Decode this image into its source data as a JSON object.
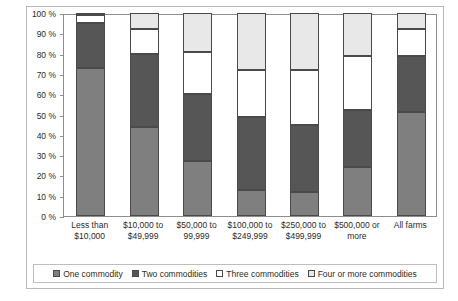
{
  "chart_data": {
    "type": "bar",
    "title": "",
    "subtitle": "",
    "xlabel": "",
    "ylabel": "",
    "ylim": [
      0,
      100
    ],
    "grid": false,
    "stacked": true,
    "stack_total": 100,
    "legend_position": "bottom",
    "categories": [
      "Less than $10,000",
      "$10,000 to $49,999",
      "$50,000 to 99,999",
      "$100,000 to $249,999",
      "$250,000 to $499,999",
      "$500,000 or more",
      "All farms"
    ],
    "category_lines": [
      [
        "Less than",
        "$10,000"
      ],
      [
        "$10,000 to",
        "$49,999"
      ],
      [
        "$50,000 to",
        "99,999"
      ],
      [
        "$100,000 to",
        "$249,999"
      ],
      [
        "$250,000 to",
        "$499,999"
      ],
      [
        "$500,000 or",
        "more"
      ],
      [
        "All farms",
        ""
      ]
    ],
    "y_ticks": [
      "0 %",
      "10 %",
      "20 %",
      "30 %",
      "40 %",
      "50 %",
      "60 %",
      "70 %",
      "80 %",
      "90 %",
      "100 %"
    ],
    "y_tick_values": [
      0,
      10,
      20,
      30,
      40,
      50,
      60,
      70,
      80,
      90,
      100
    ],
    "series": [
      {
        "name": "One commodity",
        "color": "#7f7f7f",
        "values": [
          73,
          44,
          27,
          13,
          12,
          24,
          51
        ]
      },
      {
        "name": "Two commodities",
        "color": "#565656",
        "values": [
          22,
          36,
          33,
          36,
          33,
          28,
          28
        ]
      },
      {
        "name": "Three commodities",
        "color": "#ffffff",
        "values": [
          4,
          12,
          21,
          23,
          27,
          27,
          13
        ]
      },
      {
        "name": "Four or more commodities",
        "color": "#e8e8e8",
        "values": [
          1,
          8,
          19,
          28,
          28,
          21,
          8
        ]
      }
    ]
  },
  "legend": {
    "items": [
      {
        "label": "One commodity",
        "color": "#7f7f7f"
      },
      {
        "label": "Two commodities",
        "color": "#565656"
      },
      {
        "label": "Three commodities",
        "color": "#ffffff"
      },
      {
        "label": "Four or more commodities",
        "color": "#e8e8e8"
      }
    ]
  }
}
